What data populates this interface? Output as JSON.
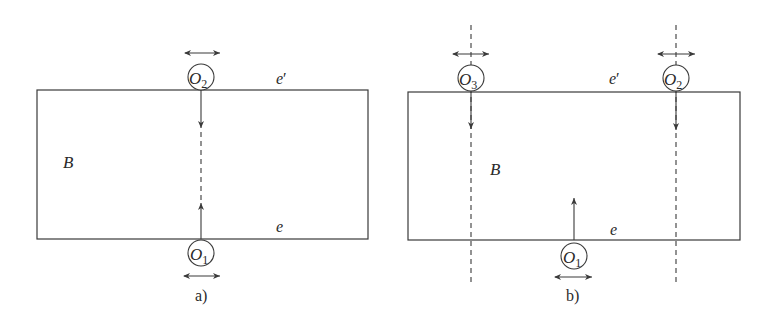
{
  "figure": {
    "panels": [
      {
        "id": "a",
        "caption": "a)",
        "region_label": "B",
        "edge_top_label": "e",
        "edge_top_prime": "′",
        "edge_bottom_label": "e",
        "objects": [
          {
            "name": "O",
            "sub": "2",
            "position": "top-edge",
            "arrow": "down",
            "motion": "horizontal-double-arrow"
          },
          {
            "name": "O",
            "sub": "1",
            "position": "bottom-edge",
            "arrow": "up",
            "motion": "horizontal-double-arrow"
          }
        ],
        "path_style": "solid-dashed-solid centre line"
      },
      {
        "id": "b",
        "caption": "b)",
        "region_label": "B",
        "edge_top_label": "e",
        "edge_top_prime": "′",
        "edge_bottom_label": "e",
        "objects": [
          {
            "name": "O",
            "sub": "3",
            "position": "top-edge-left",
            "arrow": "down",
            "motion": "horizontal-double-arrow"
          },
          {
            "name": "O",
            "sub": "2",
            "position": "top-edge-right",
            "arrow": "down",
            "motion": "horizontal-double-arrow"
          },
          {
            "name": "O",
            "sub": "1",
            "position": "bottom-edge-centre",
            "arrow": "up",
            "motion": "horizontal-double-arrow"
          }
        ],
        "path_style": "dashed vertical guide lines through O3 and O2"
      }
    ],
    "colors": {
      "stroke": "#3a3a3a",
      "text": "#2a2a2a",
      "background": "#ffffff"
    }
  }
}
